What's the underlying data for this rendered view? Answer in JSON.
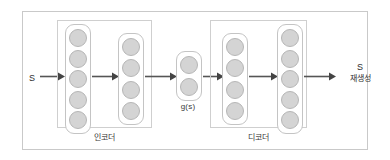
{
  "diagram": {
    "colors": {
      "frame_border": "#c9c9c9",
      "group_border": "#cfcfcf",
      "layer_border": "#c4c4c4",
      "node_fill": "#d4d4d4",
      "node_border": "#b6b6b6",
      "arrow": "#555555",
      "text": "#2e2e2e",
      "background": "#ffffff"
    },
    "input": {
      "label": "S"
    },
    "output": {
      "label_line_1": "S",
      "label_line_2": "재생성"
    },
    "bottleneck": {
      "label": "g(s)",
      "node_count": 2
    },
    "groups": [
      {
        "name": "encoder",
        "label": "인코더",
        "layers": [
          {
            "name": "encoder-layer-1",
            "node_count": 5
          },
          {
            "name": "encoder-layer-2",
            "node_count": 4
          }
        ]
      },
      {
        "name": "decoder",
        "label": "디코더",
        "layers": [
          {
            "name": "decoder-layer-1",
            "node_count": 4
          },
          {
            "name": "decoder-layer-2",
            "node_count": 5
          }
        ]
      }
    ],
    "arrows": [
      {
        "name": "arrow-input-to-encoder1"
      },
      {
        "name": "arrow-encoder1-to-encoder2"
      },
      {
        "name": "arrow-encoder2-to-bottleneck"
      },
      {
        "name": "arrow-bottleneck-to-decoder1"
      },
      {
        "name": "arrow-decoder1-to-decoder2"
      },
      {
        "name": "arrow-decoder2-to-output"
      }
    ]
  }
}
